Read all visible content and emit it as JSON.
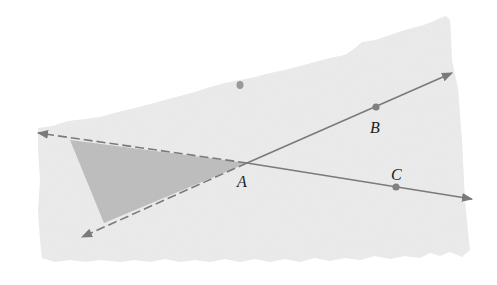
{
  "diagram": {
    "type": "geometry-angle",
    "colors": {
      "background": "#ffffff",
      "region_fill": "#ececec",
      "triangle_fill": "#bdbdbd",
      "line": "#7a7a7a",
      "point": "#808080",
      "label": "#222222"
    },
    "points": [
      {
        "id": "A",
        "label": "A",
        "x": 247,
        "y": 163,
        "label_x": 237,
        "label_y": 187,
        "marked": false
      },
      {
        "id": "B",
        "label": "B",
        "x": 376,
        "y": 107,
        "label_x": 370,
        "label_y": 133,
        "marked": true
      },
      {
        "id": "C",
        "label": "C",
        "x": 396,
        "y": 187,
        "label_x": 391,
        "label_y": 180,
        "marked": true
      }
    ],
    "rays": [
      {
        "id": "ray-AB",
        "from": "A",
        "through": "B",
        "end_x": 452,
        "end_y": 73,
        "style": "solid"
      },
      {
        "id": "ray-AC",
        "from": "A",
        "through": "C",
        "end_x": 472,
        "end_y": 199,
        "style": "solid"
      },
      {
        "id": "ray-A-opposite-C",
        "from": "A",
        "end_x": 38,
        "end_y": 133,
        "style": "dashed"
      },
      {
        "id": "ray-A-opposite-B",
        "from": "A",
        "end_x": 82,
        "end_y": 237,
        "style": "dashed"
      }
    ],
    "shaded_triangle": [
      [
        70,
        140
      ],
      [
        247,
        163
      ],
      [
        104,
        223
      ]
    ],
    "stray_mark": {
      "x": 240,
      "y": 85
    }
  }
}
